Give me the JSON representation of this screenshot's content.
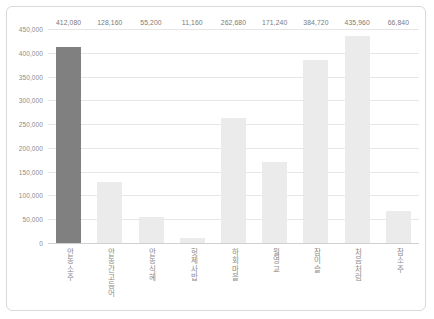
{
  "chart_data": {
    "type": "bar",
    "title": "",
    "subtitle": "",
    "xlabel": "",
    "ylabel": "",
    "ylim": [
      0,
      450000
    ],
    "grid": true,
    "legend": false,
    "yticks": [
      "450,000",
      "400,000",
      "350,000",
      "300,000",
      "250,000",
      "200,000",
      "150,000",
      "100,000",
      "50,000",
      "0"
    ],
    "ytick_values": [
      450000,
      400000,
      350000,
      300000,
      250000,
      200000,
      150000,
      100000,
      50000,
      0
    ],
    "categories": [
      "안동소주",
      "안동간고등어",
      "안동식혜",
      "헛제사밥",
      "하회마을",
      "월영교",
      "참이슬",
      "처음처럼",
      "참소주"
    ],
    "values": [
      412080,
      128160,
      55200,
      11160,
      262680,
      171240,
      384720,
      435960,
      66840
    ],
    "value_labels": [
      "412,080",
      "128,160",
      "55,200",
      "11,160",
      "262,680",
      "171,240",
      "384,720",
      "435,960",
      "66,840"
    ],
    "highlight_index": 0,
    "colors": {
      "bar": "#ebebeb",
      "bar_highlight": "#808080",
      "grid": "#e6e6e6",
      "axis": "#d0d0d0",
      "text": "#8c8c8c",
      "border": "#d9d9d9",
      "background": "#ffffff"
    }
  }
}
